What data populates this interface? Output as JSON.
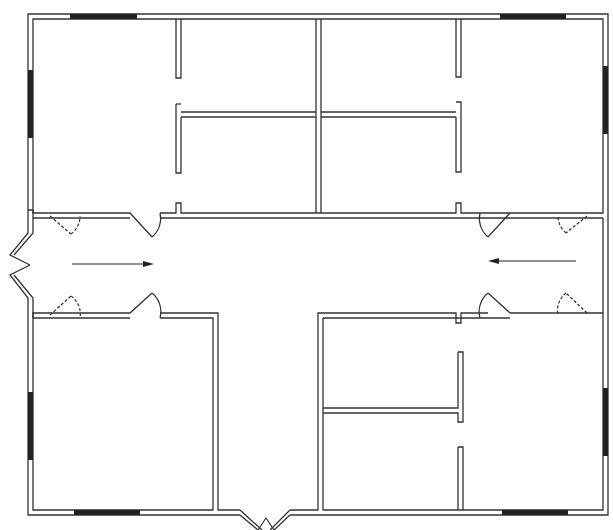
{
  "diagram": {
    "type": "floor-plan",
    "rooms": [
      {
        "id": "nw-office"
      },
      {
        "id": "n-room-1"
      },
      {
        "id": "n-room-2"
      },
      {
        "id": "ne-office"
      },
      {
        "id": "n-room-3"
      },
      {
        "id": "n-room-4"
      },
      {
        "id": "corridor-east-west"
      },
      {
        "id": "corridor-south"
      },
      {
        "id": "sw-office"
      },
      {
        "id": "se-room-1"
      },
      {
        "id": "se-room-2"
      },
      {
        "id": "se-office"
      }
    ],
    "arrows": [
      {
        "id": "arrow-east",
        "direction": "right"
      },
      {
        "id": "arrow-west",
        "direction": "left"
      }
    ],
    "entrances": [
      "west",
      "east",
      "south"
    ],
    "colors": {
      "wall": "#333333",
      "window": "#222222",
      "background": "#ffffff"
    }
  }
}
